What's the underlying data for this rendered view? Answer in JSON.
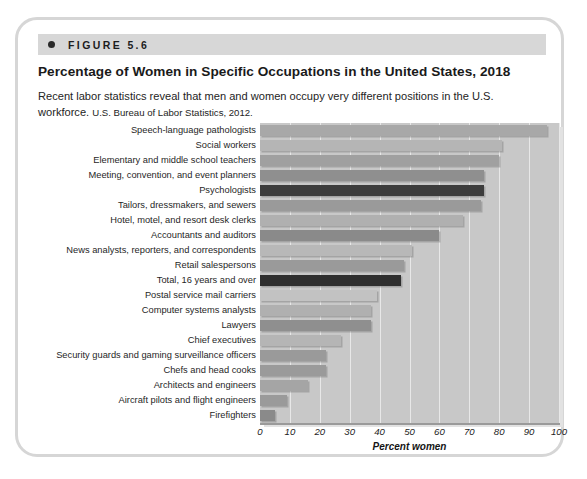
{
  "figure": {
    "number_label": "FIGURE 5.6",
    "bullet_icon": "bullet-dot-icon",
    "title": "Percentage of Women in Specific Occupations in the United States, 2018",
    "caption": "Recent labor statistics reveal that men and women occupy very different positions in the U.S. workforce.",
    "source": "U.S. Bureau of Labor Statistics, 2012."
  },
  "colors": {
    "header_bar": "#d7d7d7",
    "card_border": "#d6d6d6",
    "plot_background": "#c8c8c8",
    "gridline": "#e8e8e8",
    "bar_light": "#bdbdbd",
    "bar_mid": "#9a9a9a",
    "bar_dark": "#8a8a8a",
    "bar_darkest": "#3c3c3c",
    "text": "#1a1a1a"
  },
  "chart_data": {
    "type": "bar",
    "orientation": "horizontal",
    "title": "Percentage of Women in Specific Occupations in the United States, 2018",
    "xlabel": "Percent women",
    "ylabel": "",
    "xlim": [
      0,
      100
    ],
    "xticks": [
      0,
      10,
      20,
      30,
      40,
      50,
      60,
      70,
      80,
      90,
      100
    ],
    "grid": true,
    "legend": "none",
    "categories": [
      "Speech-language pathologists",
      "Social workers",
      "Elementary and middle school teachers",
      "Meeting, convention, and event planners",
      "Psychologists",
      "Tailors, dressmakers, and sewers",
      "Hotel, motel, and resort desk clerks",
      "Accountants and auditors",
      "News analysts, reporters, and correspondents",
      "Retail salespersons",
      "Total, 16 years and over",
      "Postal service mail carriers",
      "Computer systems analysts",
      "Lawyers",
      "Chief executives",
      "Security guards and gaming surveillance officers",
      "Chefs and head cooks",
      "Architects and engineers",
      "Aircraft pilots and flight engineers",
      "Firefighters"
    ],
    "values": [
      96,
      81,
      80,
      75,
      75,
      74,
      68,
      60,
      51,
      48,
      47,
      39,
      37,
      37,
      27,
      22,
      22,
      16,
      9,
      5
    ],
    "bar_colors": [
      "#a8a8a8",
      "#b5b5b5",
      "#a0a0a0",
      "#8f8f8f",
      "#3c3c3c",
      "#9a9a9a",
      "#b0b0b0",
      "#8a8a8a",
      "#b8b8b8",
      "#9a9a9a",
      "#2f2f2f",
      "#c2c2c2",
      "#b0b0b0",
      "#8f8f8f",
      "#b5b5b5",
      "#9a9a9a",
      "#9a9a9a",
      "#a5a5a5",
      "#9a9a9a",
      "#8a8a8a"
    ]
  }
}
